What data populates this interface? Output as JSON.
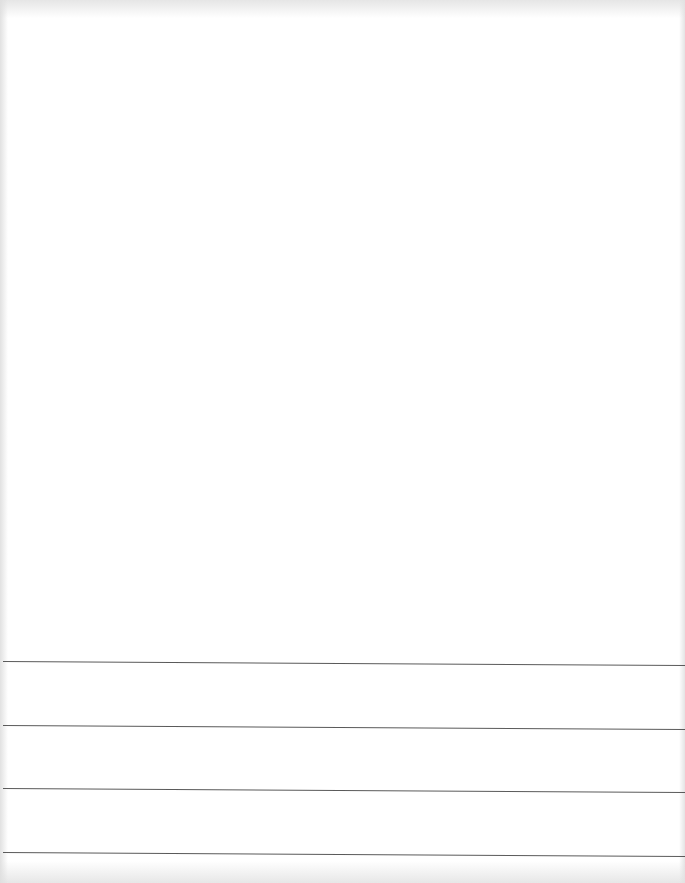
{
  "document": {
    "type": "blank scanned page",
    "text_content": "",
    "background_color": "#ffffff",
    "rule_color": "#5a5a5a",
    "ruled_lines": [
      {
        "y": 661
      },
      {
        "y": 725
      },
      {
        "y": 788
      },
      {
        "y": 852
      }
    ]
  }
}
